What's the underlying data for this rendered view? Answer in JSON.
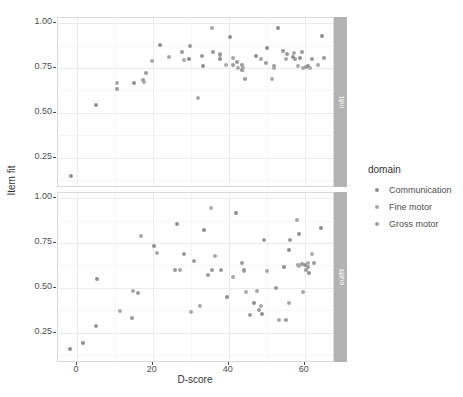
{
  "chart_data": {
    "type": "scatter",
    "title": "",
    "xlabel": "D-score",
    "ylabel": "Item fit",
    "xlim": [
      -5,
      68
    ],
    "ylim": [
      0.08,
      1.03
    ],
    "grid": true,
    "legend_position": "right",
    "xticks": [
      "0",
      "20",
      "40",
      "60"
    ],
    "xtick_values": [
      0,
      20,
      40,
      60
    ],
    "yticks": [
      "0.25",
      "0.50",
      "0.75",
      "1.00"
    ],
    "ytick_values": [
      0.25,
      0.5,
      0.75,
      1.0
    ],
    "facets": [
      {
        "label": "infit",
        "points": [
          {
            "x": -1.5,
            "y": 0.145,
            "domain": "Communication"
          },
          {
            "x": 5.0,
            "y": 0.545,
            "domain": "Communication"
          },
          {
            "x": 10.5,
            "y": 0.668,
            "domain": "Fine motor"
          },
          {
            "x": 10.6,
            "y": 0.635,
            "domain": "Gross motor"
          },
          {
            "x": 15.0,
            "y": 0.665,
            "domain": "Communication"
          },
          {
            "x": 17.4,
            "y": 0.682,
            "domain": "Gross motor"
          },
          {
            "x": 17.6,
            "y": 0.672,
            "domain": "Fine motor"
          },
          {
            "x": 18.2,
            "y": 0.725,
            "domain": "Gross motor"
          },
          {
            "x": 19.8,
            "y": 0.79,
            "domain": "Fine motor"
          },
          {
            "x": 22.0,
            "y": 0.878,
            "domain": "Communication"
          },
          {
            "x": 24.3,
            "y": 0.812,
            "domain": "Fine motor"
          },
          {
            "x": 27.6,
            "y": 0.84,
            "domain": "Gross motor"
          },
          {
            "x": 28.2,
            "y": 0.795,
            "domain": "Fine motor"
          },
          {
            "x": 29.4,
            "y": 0.8,
            "domain": "Communication"
          },
          {
            "x": 29.9,
            "y": 0.875,
            "domain": "Gross motor"
          },
          {
            "x": 31.8,
            "y": 0.585,
            "domain": "Fine motor"
          },
          {
            "x": 33.0,
            "y": 0.818,
            "domain": "Gross motor"
          },
          {
            "x": 33.3,
            "y": 0.762,
            "domain": "Communication"
          },
          {
            "x": 35.6,
            "y": 0.975,
            "domain": "Fine motor"
          },
          {
            "x": 35.9,
            "y": 0.838,
            "domain": "Gross motor"
          },
          {
            "x": 37.6,
            "y": 0.828,
            "domain": "Fine motor"
          },
          {
            "x": 37.7,
            "y": 0.8,
            "domain": "Communication"
          },
          {
            "x": 37.8,
            "y": 0.822,
            "domain": "Gross motor"
          },
          {
            "x": 39.2,
            "y": 0.768,
            "domain": "Fine motor"
          },
          {
            "x": 40.4,
            "y": 0.925,
            "domain": "Communication"
          },
          {
            "x": 41.1,
            "y": 0.768,
            "domain": "Gross motor"
          },
          {
            "x": 41.2,
            "y": 0.806,
            "domain": "Fine motor"
          },
          {
            "x": 42.1,
            "y": 0.782,
            "domain": "Gross motor"
          },
          {
            "x": 42.5,
            "y": 0.748,
            "domain": "Fine motor"
          },
          {
            "x": 43.5,
            "y": 0.74,
            "domain": "Communication"
          },
          {
            "x": 43.6,
            "y": 0.765,
            "domain": "Gross motor"
          },
          {
            "x": 43.8,
            "y": 0.752,
            "domain": "Fine motor"
          },
          {
            "x": 44.2,
            "y": 0.69,
            "domain": "Gross motor"
          },
          {
            "x": 47.3,
            "y": 0.82,
            "domain": "Communication"
          },
          {
            "x": 48.6,
            "y": 0.8,
            "domain": "Fine motor"
          },
          {
            "x": 49.8,
            "y": 0.78,
            "domain": "Gross motor"
          },
          {
            "x": 50.2,
            "y": 0.862,
            "domain": "Communication"
          },
          {
            "x": 51.3,
            "y": 0.69,
            "domain": "Fine motor"
          },
          {
            "x": 51.8,
            "y": 0.762,
            "domain": "Gross motor"
          },
          {
            "x": 52.0,
            "y": 0.752,
            "domain": "Fine motor"
          },
          {
            "x": 53.0,
            "y": 0.975,
            "domain": "Communication"
          },
          {
            "x": 54.2,
            "y": 0.845,
            "domain": "Gross motor"
          },
          {
            "x": 55.0,
            "y": 0.8,
            "domain": "Fine motor"
          },
          {
            "x": 55.4,
            "y": 0.828,
            "domain": "Gross motor"
          },
          {
            "x": 56.8,
            "y": 0.812,
            "domain": "Communication"
          },
          {
            "x": 57.2,
            "y": 0.835,
            "domain": "Fine motor"
          },
          {
            "x": 57.4,
            "y": 0.8,
            "domain": "Gross motor"
          },
          {
            "x": 58.2,
            "y": 0.762,
            "domain": "Fine motor"
          },
          {
            "x": 58.8,
            "y": 0.805,
            "domain": "Communication"
          },
          {
            "x": 59.2,
            "y": 0.838,
            "domain": "Gross motor"
          },
          {
            "x": 59.6,
            "y": 0.752,
            "domain": "Fine motor"
          },
          {
            "x": 60.4,
            "y": 0.755,
            "domain": "Gross motor"
          },
          {
            "x": 60.9,
            "y": 0.76,
            "domain": "Communication"
          },
          {
            "x": 61.4,
            "y": 0.752,
            "domain": "Fine motor"
          },
          {
            "x": 62.0,
            "y": 0.8,
            "domain": "Gross motor"
          },
          {
            "x": 63.5,
            "y": 0.768,
            "domain": "Fine motor"
          },
          {
            "x": 64.5,
            "y": 0.928,
            "domain": "Communication"
          },
          {
            "x": 65.2,
            "y": 0.805,
            "domain": "Gross motor"
          }
        ]
      },
      {
        "label": "outfit",
        "points": [
          {
            "x": -1.8,
            "y": 0.158,
            "domain": "Communication"
          },
          {
            "x": 1.6,
            "y": 0.192,
            "domain": "Communication"
          },
          {
            "x": 5.0,
            "y": 0.285,
            "domain": "Gross motor"
          },
          {
            "x": 5.2,
            "y": 0.548,
            "domain": "Communication"
          },
          {
            "x": 11.4,
            "y": 0.368,
            "domain": "Fine motor"
          },
          {
            "x": 14.4,
            "y": 0.33,
            "domain": "Gross motor"
          },
          {
            "x": 14.8,
            "y": 0.482,
            "domain": "Fine motor"
          },
          {
            "x": 16.2,
            "y": 0.47,
            "domain": "Gross motor"
          },
          {
            "x": 16.8,
            "y": 0.79,
            "domain": "Fine motor"
          },
          {
            "x": 20.2,
            "y": 0.735,
            "domain": "Communication"
          },
          {
            "x": 21.0,
            "y": 0.695,
            "domain": "Fine motor"
          },
          {
            "x": 25.9,
            "y": 0.598,
            "domain": "Gross motor"
          },
          {
            "x": 26.3,
            "y": 0.855,
            "domain": "Communication"
          },
          {
            "x": 27.2,
            "y": 0.598,
            "domain": "Fine motor"
          },
          {
            "x": 28.2,
            "y": 0.688,
            "domain": "Gross motor"
          },
          {
            "x": 30.0,
            "y": 0.365,
            "domain": "Fine motor"
          },
          {
            "x": 30.9,
            "y": 0.648,
            "domain": "Gross motor"
          },
          {
            "x": 32.4,
            "y": 0.398,
            "domain": "Fine motor"
          },
          {
            "x": 33.6,
            "y": 0.822,
            "domain": "Communication"
          },
          {
            "x": 34.6,
            "y": 0.572,
            "domain": "Gross motor"
          },
          {
            "x": 35.2,
            "y": 0.948,
            "domain": "Fine motor"
          },
          {
            "x": 35.6,
            "y": 0.6,
            "domain": "Gross motor"
          },
          {
            "x": 36.4,
            "y": 0.68,
            "domain": "Fine motor"
          },
          {
            "x": 37.9,
            "y": 0.598,
            "domain": "Gross motor"
          },
          {
            "x": 39.6,
            "y": 0.448,
            "domain": "Communication"
          },
          {
            "x": 41.2,
            "y": 0.56,
            "domain": "Fine motor"
          },
          {
            "x": 41.8,
            "y": 0.92,
            "domain": "Communication"
          },
          {
            "x": 43.6,
            "y": 0.64,
            "domain": "Gross motor"
          },
          {
            "x": 43.9,
            "y": 0.592,
            "domain": "Fine motor"
          },
          {
            "x": 44.0,
            "y": 0.602,
            "domain": "Gross motor"
          },
          {
            "x": 44.5,
            "y": 0.478,
            "domain": "Fine motor"
          },
          {
            "x": 45.6,
            "y": 0.348,
            "domain": "Gross motor"
          },
          {
            "x": 46.6,
            "y": 0.415,
            "domain": "Communication"
          },
          {
            "x": 47.4,
            "y": 0.48,
            "domain": "Fine motor"
          },
          {
            "x": 48.0,
            "y": 0.378,
            "domain": "Gross motor"
          },
          {
            "x": 48.4,
            "y": 0.398,
            "domain": "Fine motor"
          },
          {
            "x": 48.8,
            "y": 0.355,
            "domain": "Communication"
          },
          {
            "x": 49.4,
            "y": 0.765,
            "domain": "Gross motor"
          },
          {
            "x": 50.2,
            "y": 0.592,
            "domain": "Fine motor"
          },
          {
            "x": 52.4,
            "y": 0.498,
            "domain": "Gross motor"
          },
          {
            "x": 53.2,
            "y": 0.318,
            "domain": "Fine motor"
          },
          {
            "x": 54.6,
            "y": 0.615,
            "domain": "Communication"
          },
          {
            "x": 55.2,
            "y": 0.32,
            "domain": "Gross motor"
          },
          {
            "x": 55.8,
            "y": 0.418,
            "domain": "Fine motor"
          },
          {
            "x": 56.0,
            "y": 0.712,
            "domain": "Communication"
          },
          {
            "x": 56.2,
            "y": 0.768,
            "domain": "Gross motor"
          },
          {
            "x": 57.9,
            "y": 0.88,
            "domain": "Fine motor"
          },
          {
            "x": 58.2,
            "y": 0.625,
            "domain": "Gross motor"
          },
          {
            "x": 58.4,
            "y": 0.8,
            "domain": "Communication"
          },
          {
            "x": 58.6,
            "y": 0.62,
            "domain": "Fine motor"
          },
          {
            "x": 59.3,
            "y": 0.632,
            "domain": "Gross motor"
          },
          {
            "x": 59.6,
            "y": 0.478,
            "domain": "Fine motor"
          },
          {
            "x": 60.2,
            "y": 0.625,
            "domain": "Communication"
          },
          {
            "x": 60.4,
            "y": 0.598,
            "domain": "Gross motor"
          },
          {
            "x": 60.8,
            "y": 0.64,
            "domain": "Fine motor"
          },
          {
            "x": 61.0,
            "y": 0.618,
            "domain": "Gross motor"
          },
          {
            "x": 61.2,
            "y": 0.585,
            "domain": "Communication"
          },
          {
            "x": 62.0,
            "y": 0.688,
            "domain": "Fine motor"
          },
          {
            "x": 62.4,
            "y": 0.638,
            "domain": "Gross motor"
          },
          {
            "x": 64.2,
            "y": 0.832,
            "domain": "Communication"
          }
        ]
      }
    ]
  },
  "legend": {
    "title": "domain",
    "items": [
      {
        "label": "Communication",
        "color": "#8e8e8e"
      },
      {
        "label": "Fine motor",
        "color": "#a8a8a8"
      },
      {
        "label": "Gross motor",
        "color": "#9a9a9a"
      }
    ]
  },
  "strips": {
    "top": "infit",
    "bottom": "outfit",
    "background": "#b3b3b3",
    "text_color": "#ffffff"
  },
  "axes": {
    "x_title": "D-score",
    "y_title": "Item fit"
  },
  "colors": {
    "panel_background": "#ffffff",
    "panel_border": "#d9d9d9",
    "grid_major": "#ebebeb",
    "grid_minor": "#f4f4f4",
    "text": "#4d4d4d"
  }
}
